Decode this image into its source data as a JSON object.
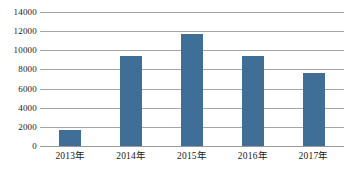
{
  "chart_data": {
    "type": "bar",
    "title": "",
    "subtitle": "",
    "xlabel": "",
    "ylabel": "",
    "categories": [
      "2013年",
      "2014年",
      "2015年",
      "2016年",
      "2017年"
    ],
    "values": [
      1680,
      9420,
      11730,
      9370,
      7600
    ],
    "series": [
      {
        "name": "",
        "values": [
          1680,
          9420,
          11730,
          9370,
          7600
        ]
      }
    ],
    "ylim": [
      0,
      14000
    ],
    "yticks": [
      0,
      2000,
      4000,
      6000,
      8000,
      10000,
      12000,
      14000
    ],
    "ytick_labels": [
      "0",
      "2000",
      "4000",
      "6000",
      "8000",
      "10000",
      "12000",
      "14000"
    ],
    "grid": true,
    "grid_axis": "y",
    "legend": false,
    "legend_position": "none",
    "bar_color": "#3f6f96",
    "grid_color": "#a6a6a6",
    "background_color": "#ffffff",
    "annotations": []
  }
}
